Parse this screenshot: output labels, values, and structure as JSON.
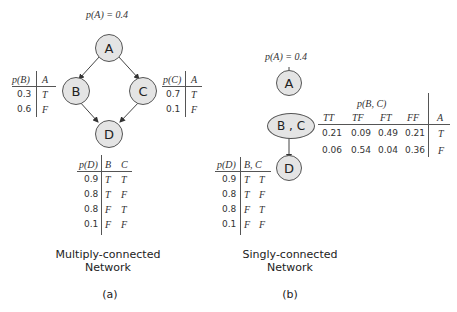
{
  "panel_a": {
    "prior": "p(A) = 0.4",
    "nodes": {
      "A": "A",
      "B": "B",
      "C": "C",
      "D": "D"
    },
    "table_b": {
      "header": [
        "p(B)",
        "A"
      ],
      "rows": [
        [
          "0.3",
          "T"
        ],
        [
          "0.6",
          "F"
        ]
      ]
    },
    "table_c": {
      "header": [
        "p(C)",
        "A"
      ],
      "rows": [
        [
          "0.7",
          "T"
        ],
        [
          "0.1",
          "F"
        ]
      ]
    },
    "table_d": {
      "header": [
        "p(D)",
        "B",
        "C"
      ],
      "rows": [
        [
          "0.9",
          "T",
          "T"
        ],
        [
          "0.8",
          "T",
          "F"
        ],
        [
          "0.8",
          "F",
          "T"
        ],
        [
          "0.1",
          "F",
          "F"
        ]
      ]
    },
    "caption_line1": "Multiply-connected",
    "caption_line2": "Network",
    "label": "(a)"
  },
  "panel_b": {
    "prior": "p(A) = 0.4",
    "nodes": {
      "A": "A",
      "BC": "B , C",
      "D": "D"
    },
    "table_bc": {
      "title": "p(B, C)",
      "header": [
        "TT",
        "TF",
        "FT",
        "FF",
        "A"
      ],
      "rows": [
        [
          "0.21",
          "0.09",
          "0.49",
          "0.21",
          "T"
        ],
        [
          "0.06",
          "0.54",
          "0.04",
          "0.36",
          "F"
        ]
      ]
    },
    "table_d": {
      "header": [
        "p(D)",
        "B, C"
      ],
      "rows": [
        [
          "0.9",
          "T",
          "T"
        ],
        [
          "0.8",
          "T",
          "F"
        ],
        [
          "0.8",
          "F",
          "T"
        ],
        [
          "0.1",
          "F",
          "F"
        ]
      ]
    },
    "caption_line1": "Singly-connected",
    "caption_line2": "Network",
    "label": "(b)"
  }
}
